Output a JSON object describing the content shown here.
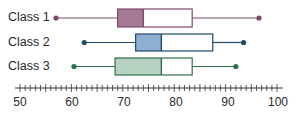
{
  "chart_data": {
    "type": "boxplot",
    "title": "",
    "xlabel": "",
    "ylabel": "",
    "xlim": [
      50,
      100
    ],
    "x_ticks": [
      50,
      60,
      70,
      80,
      90,
      100
    ],
    "x_tick_labels": [
      "50",
      "60",
      "70",
      "80",
      "90",
      "100"
    ],
    "minor_tick_step": 1,
    "grid": false,
    "series": [
      {
        "name": "Class 1",
        "min": 57,
        "q1": 69,
        "median": 74,
        "q3": 83.5,
        "max": 96.5,
        "fill": "#a67a96",
        "stroke": "#7d4a6c"
      },
      {
        "name": "Class 2",
        "min": 62.5,
        "q1": 72.5,
        "median": 77.5,
        "q3": 87.5,
        "max": 93.5,
        "fill": "#8fb0d2",
        "stroke": "#1f4a6a"
      },
      {
        "name": "Class 3",
        "min": 60.5,
        "q1": 68.5,
        "median": 77.5,
        "q3": 83.5,
        "max": 92,
        "fill": "#b7d3c0",
        "stroke": "#2f6e4a"
      }
    ]
  },
  "labels": {
    "class1": "Class 1",
    "class2": "Class 2",
    "class3": "Class 3"
  },
  "axis": {
    "t50": "50",
    "t60": "60",
    "t70": "70",
    "t80": "80",
    "t90": "90",
    "t100": "100"
  }
}
